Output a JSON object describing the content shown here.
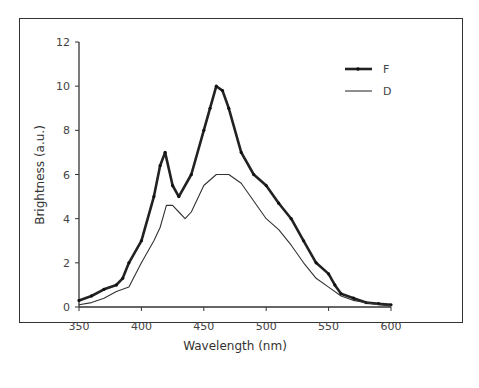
{
  "chart_data": {
    "type": "line",
    "title": "",
    "xlabel": "Wavelength (nm)",
    "ylabel": "Brightness (a.u.)",
    "xlim": [
      350,
      600
    ],
    "ylim": [
      0,
      12
    ],
    "xticks": [
      350,
      400,
      450,
      500,
      550,
      600
    ],
    "yticks": [
      0,
      2,
      4,
      6,
      8,
      10,
      12
    ],
    "grid": false,
    "legend_position": "top-right",
    "series": [
      {
        "name": "F",
        "style": "thick line with markers",
        "color": "#222222",
        "x": [
          350,
          360,
          370,
          380,
          385,
          390,
          400,
          410,
          415,
          419,
          425,
          430,
          440,
          450,
          455,
          460,
          465,
          470,
          480,
          490,
          500,
          510,
          520,
          530,
          540,
          550,
          555,
          560,
          570,
          580,
          590,
          600
        ],
        "values": [
          0.3,
          0.5,
          0.8,
          1.0,
          1.3,
          2.0,
          3.0,
          5.0,
          6.4,
          7.0,
          5.5,
          5.0,
          6.0,
          8.0,
          9.0,
          10.0,
          9.8,
          9.0,
          7.0,
          6.0,
          5.5,
          4.7,
          4.0,
          3.0,
          2.0,
          1.5,
          1.0,
          0.6,
          0.4,
          0.2,
          0.15,
          0.1
        ]
      },
      {
        "name": "D",
        "style": "thin line",
        "color": "#333333",
        "x": [
          350,
          360,
          370,
          380,
          390,
          400,
          410,
          415,
          420,
          425,
          430,
          435,
          440,
          450,
          460,
          470,
          480,
          490,
          500,
          510,
          520,
          530,
          540,
          550,
          560,
          570,
          580,
          590,
          600
        ],
        "values": [
          0.1,
          0.2,
          0.4,
          0.7,
          0.9,
          2.0,
          3.0,
          3.6,
          4.6,
          4.6,
          4.3,
          4.0,
          4.3,
          5.5,
          6.0,
          6.0,
          5.6,
          4.8,
          4.0,
          3.5,
          2.8,
          2.0,
          1.3,
          0.9,
          0.5,
          0.3,
          0.2,
          0.1,
          0.05
        ]
      }
    ]
  }
}
